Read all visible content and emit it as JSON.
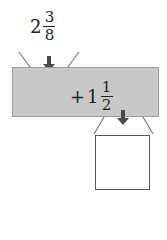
{
  "input": {
    "whole": "2",
    "numerator": "3",
    "denominator": "8"
  },
  "operation": {
    "sign": "+",
    "whole": "1",
    "numerator": "1",
    "denominator": "2"
  },
  "output": {
    "value": ""
  },
  "colors": {
    "machine_fill": "#c8c8c8",
    "arrow": "#4a4a4a",
    "line": "#777777"
  }
}
